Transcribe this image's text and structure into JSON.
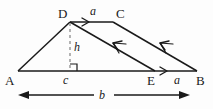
{
  "figure": {
    "type": "geometry-diagram",
    "background_color": "#fdfdfd",
    "stroke_color": "#1a1a1a",
    "dashed_color": "#8c8c8c",
    "vertices": [
      {
        "name": "A",
        "label": "A",
        "x": 18,
        "y": 71
      },
      {
        "name": "B",
        "label": "B",
        "x": 197,
        "y": 71
      },
      {
        "name": "C",
        "label": "C",
        "x": 113,
        "y": 22
      },
      {
        "name": "D",
        "label": "D",
        "x": 70,
        "y": 22
      },
      {
        "name": "E",
        "label": "E",
        "x": 155,
        "y": 71
      }
    ],
    "labels": {
      "vertex_a": "A",
      "vertex_b": "B",
      "vertex_c": "C",
      "vertex_d": "D",
      "vertex_e": "E",
      "side_dc": "a",
      "side_eb": "a",
      "base_b": "b",
      "segment_c": "c",
      "height_h": "h"
    },
    "segments": [
      {
        "name": "top-side-dc",
        "from": "D",
        "to": "C",
        "style": "solid",
        "marker": "single-arrow-forward"
      },
      {
        "name": "left-side-ad",
        "from": "A",
        "to": "D",
        "style": "solid",
        "marker": "none"
      },
      {
        "name": "base-ab",
        "from": "A",
        "to": "B",
        "style": "solid",
        "marker": "none"
      },
      {
        "name": "diagonal-de",
        "from": "D",
        "to": "E",
        "style": "solid",
        "marker": "single-arrow-backward"
      },
      {
        "name": "right-side-cb",
        "from": "C",
        "to": "B",
        "style": "solid",
        "marker": "single-arrow-backward"
      },
      {
        "name": "segment-eb",
        "from": "E",
        "to": "B",
        "style": "solid",
        "marker": "single-arrow-forward"
      },
      {
        "name": "height-dashed",
        "from": "D",
        "to": "F",
        "style": "dashed",
        "marker": "none"
      }
    ],
    "right_angle_marker": {
      "x": 70,
      "y": 71,
      "size": 7
    },
    "dimension_arrow": {
      "name": "base-dimension",
      "from_x": 18,
      "to_x": 190,
      "y": 95,
      "label": "b",
      "double_headed": true
    }
  }
}
